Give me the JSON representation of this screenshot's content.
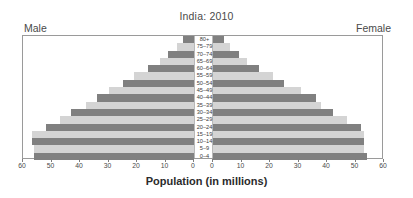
{
  "header": {
    "title": "India: 2010",
    "male_label": "Male",
    "female_label": "Female"
  },
  "axis": {
    "xlabel": "Population (in millions)",
    "ticks_left": [
      "60",
      "50",
      "40",
      "30",
      "20",
      "10",
      "0"
    ],
    "ticks_right": [
      "0",
      "10",
      "20",
      "30",
      "40",
      "50",
      "60"
    ]
  },
  "colors": {
    "bar_dark": "#808080",
    "bar_light": "#d4d4d4",
    "frame": "#9a9a9a",
    "background": "#ffffff",
    "text": "#3d3d3d"
  },
  "chart_data": {
    "type": "bar",
    "subtype": "population-pyramid",
    "title": "India: 2010",
    "xlabel": "Population (in millions)",
    "ylabel": "",
    "xlim": [
      0,
      60
    ],
    "grid": false,
    "legend": [
      "Male",
      "Female"
    ],
    "legend_position": "top-left-and-top-right",
    "categories": [
      "80+",
      "75–79",
      "70–74",
      "65–69",
      "60–64",
      "55–59",
      "50–54",
      "45–49",
      "40–44",
      "35–39",
      "30–34",
      "25–29",
      "20–24",
      "15–19",
      "10–14",
      "5–9",
      "0–4"
    ],
    "series": [
      {
        "name": "Male",
        "side": "left",
        "values": [
          4,
          6,
          9,
          12,
          16,
          21,
          25,
          30,
          34,
          38,
          43,
          47,
          52,
          57,
          57,
          56,
          56
        ]
      },
      {
        "name": "Female",
        "side": "right",
        "values": [
          4,
          6,
          9,
          12,
          16,
          21,
          25,
          31,
          36,
          38,
          42,
          47,
          52,
          53,
          53,
          53,
          54
        ]
      }
    ]
  }
}
